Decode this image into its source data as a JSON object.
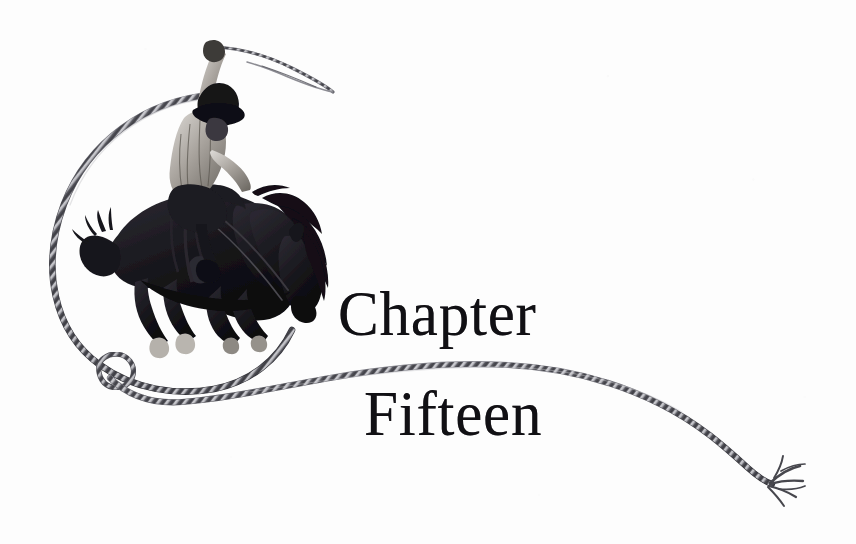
{
  "page": {
    "kind": "book-chapter-opening-page",
    "background_color": "#fdfdfd",
    "ink_color": "#111014",
    "width": 856,
    "height": 544
  },
  "heading": {
    "line1": "Chapter",
    "line2": "Fifteen",
    "full_text": "Chapter Fifteen",
    "color": "#111014"
  },
  "illustration": {
    "caption": "Cowboy riding a bucking bronco inside a lasso loop, with the rope trailing away to the right",
    "subjects": [
      "cowboy-rider",
      "bucking-horse",
      "lasso-loop",
      "rope-trail"
    ],
    "ink_color": "#1a181c",
    "rope_color": "#4a4a50",
    "rope_highlight_color": "#b9b9be"
  },
  "rope": {
    "loop_label": "lasso-loop",
    "knot_label": "honda-knot",
    "tail_label": "frayed-rope-end"
  }
}
